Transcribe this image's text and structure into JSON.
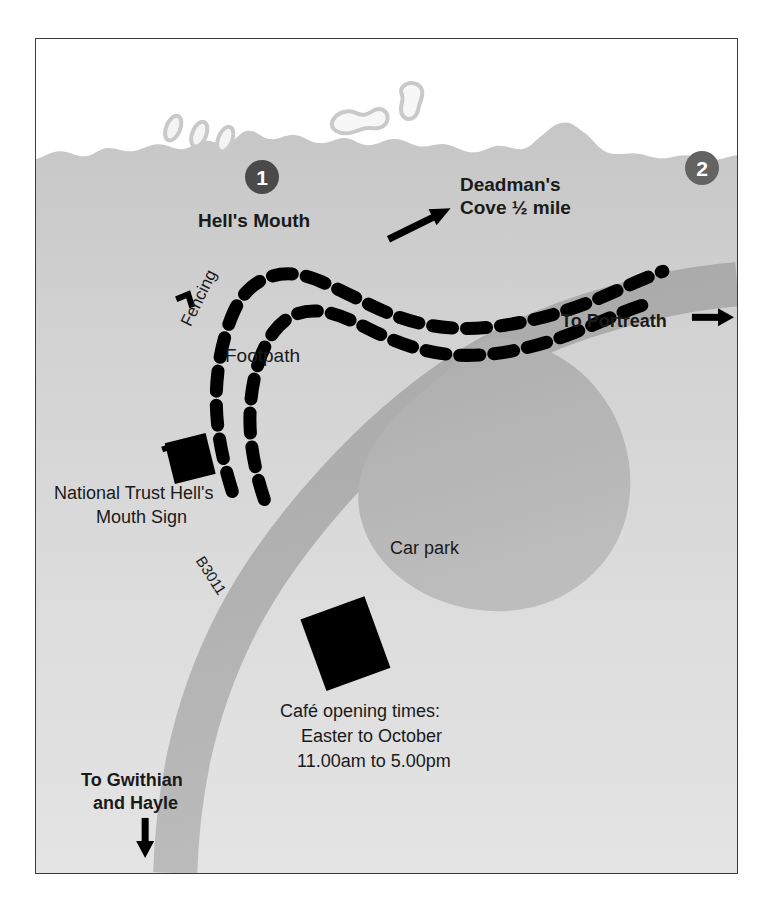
{
  "map": {
    "title": "Hell's Mouth and Deadman's Cove walk map",
    "frame": {
      "x": 35,
      "y": 38,
      "width": 703,
      "height": 836
    },
    "colors": {
      "sea": "#ffffff",
      "land_upper": "#c9c9c9",
      "land_lower": "#dcdcdc",
      "land_mid": "#d4d4d4",
      "road": "#b0b0b0",
      "carpark": "#b4b4b4",
      "rock_outline": "#c9c9c9",
      "rock_fill": "#f2f2f2",
      "path_dash": "#000000",
      "marker_fill": "#4a4a4a",
      "marker_fill_light": "#636363",
      "text": "#1a1a1a",
      "frame_border": "#3b3b3b",
      "building": "#000000"
    },
    "markers": [
      {
        "id": "marker-1",
        "label": "1",
        "x": 244,
        "y": 159
      },
      {
        "id": "marker-2",
        "label": "2",
        "x": 684,
        "y": 150
      }
    ],
    "labels": [
      {
        "id": "hells-mouth",
        "text": "Hell's Mouth",
        "style": "bold",
        "size": 19,
        "x": 197,
        "y": 209
      },
      {
        "id": "deadmans-cove-l1",
        "text": "Deadman's",
        "style": "bold",
        "size": 19,
        "x": 459,
        "y": 173
      },
      {
        "id": "deadmans-cove-l2",
        "text": "Cove ½ mile",
        "style": "bold",
        "size": 19,
        "x": 459,
        "y": 196
      },
      {
        "id": "to-portreath",
        "text": "To Portreath",
        "style": "bold",
        "size": 18,
        "x": 560,
        "y": 310
      },
      {
        "id": "fencing",
        "text": "Fencing",
        "style": "plain",
        "size": 17,
        "x": 176,
        "y": 320
      },
      {
        "id": "footpath",
        "text": "Footpath",
        "style": "plain",
        "size": 19,
        "x": 224,
        "y": 344
      },
      {
        "id": "nt-sign-l1",
        "text": "National Trust Hell's",
        "style": "plain",
        "size": 18,
        "x": 53,
        "y": 482
      },
      {
        "id": "nt-sign-l2",
        "text": "Mouth Sign",
        "style": "plain",
        "size": 18,
        "x": 95,
        "y": 506
      },
      {
        "id": "b3011",
        "text": "B3011",
        "style": "plain",
        "size": 15,
        "x": 206,
        "y": 552
      },
      {
        "id": "car-park",
        "text": "Car park",
        "style": "plain",
        "size": 18,
        "x": 389,
        "y": 537
      },
      {
        "id": "cafe-l1",
        "text": "Café opening times:",
        "style": "plain",
        "size": 18,
        "x": 279,
        "y": 700
      },
      {
        "id": "cafe-l2",
        "text": "Easter to October",
        "style": "plain",
        "size": 18,
        "x": 300,
        "y": 725
      },
      {
        "id": "cafe-l3",
        "text": "11.00am to 5.00pm",
        "style": "plain",
        "size": 18,
        "x": 296,
        "y": 750
      },
      {
        "id": "to-gwithian-l1",
        "text": "To Gwithian",
        "style": "bold",
        "size": 18,
        "x": 80,
        "y": 769
      },
      {
        "id": "to-gwithian-l2",
        "text": "and Hayle",
        "style": "bold",
        "size": 18,
        "x": 92,
        "y": 792
      }
    ],
    "features": {
      "sea_name": "sea",
      "coastline_name": "coastline",
      "footpath_name": "footpath-dashed-trail",
      "fence_name": "fencing-line",
      "road_name": "road-b3011",
      "carpark_name": "car-park-area",
      "nt_sign_name": "national-trust-sign-marker",
      "cafe_building_name": "cafe-building-marker",
      "rocks_name": "offshore-rocks"
    },
    "direction_arrows": [
      {
        "id": "arrow-to-deadmans",
        "direction": "north-east"
      },
      {
        "id": "arrow-to-portreath",
        "direction": "east"
      },
      {
        "id": "arrow-to-gwithian",
        "direction": "south"
      }
    ]
  }
}
